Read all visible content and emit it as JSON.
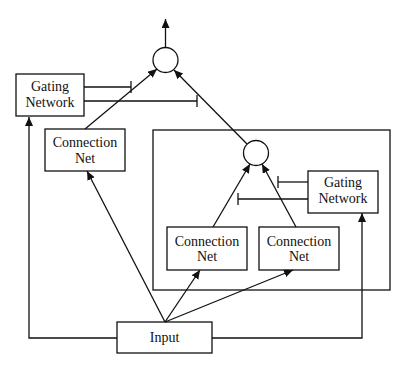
{
  "diagram": {
    "colors": {
      "stroke": "#111111",
      "background": "#ffffff"
    },
    "nodes": {
      "outer_gating": {
        "line1": "Gating",
        "line2": "Network"
      },
      "outer_connection": {
        "line1": "Connection",
        "line2": "Net"
      },
      "inner_gating": {
        "line1": "Gating",
        "line2": "Network"
      },
      "inner_connection_left": {
        "line1": "Connection",
        "line2": "Net"
      },
      "inner_connection_right": {
        "line1": "Connection",
        "line2": "Net"
      },
      "input": {
        "label": "Input"
      }
    },
    "combiners": [
      {
        "id": "outer-combiner",
        "shape": "circle"
      },
      {
        "id": "inner-combiner",
        "shape": "circle"
      }
    ],
    "edges": [
      {
        "from": "outer-combiner",
        "to": "output",
        "type": "arrow"
      },
      {
        "from": "outer_connection",
        "to": "outer-combiner",
        "type": "arrow"
      },
      {
        "from": "inner-combiner",
        "to": "outer-combiner",
        "type": "arrow"
      },
      {
        "from": "outer_gating",
        "to": "outer_connection-edge",
        "type": "gate"
      },
      {
        "from": "outer_gating",
        "to": "inner-combiner-edge",
        "type": "gate"
      },
      {
        "from": "inner_connection_left",
        "to": "inner-combiner",
        "type": "arrow"
      },
      {
        "from": "inner_connection_right",
        "to": "inner-combiner",
        "type": "arrow"
      },
      {
        "from": "inner_gating",
        "to": "inner_connection_right-edge",
        "type": "gate"
      },
      {
        "from": "inner_gating",
        "to": "inner_connection_left-edge",
        "type": "gate"
      },
      {
        "from": "input",
        "to": "outer_connection",
        "type": "arrow"
      },
      {
        "from": "input",
        "to": "inner_connection_left",
        "type": "arrow"
      },
      {
        "from": "input",
        "to": "inner_connection_right",
        "type": "arrow"
      },
      {
        "from": "input",
        "to": "outer_gating",
        "type": "arrow"
      },
      {
        "from": "input",
        "to": "inner_gating",
        "type": "arrow"
      }
    ]
  }
}
